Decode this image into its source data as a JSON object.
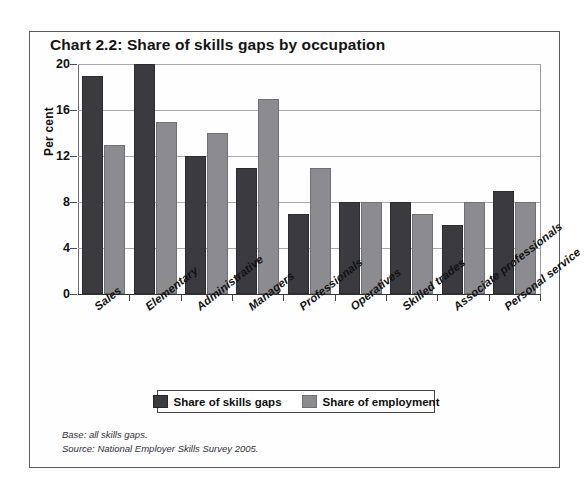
{
  "chart_data": {
    "type": "bar",
    "title": "Chart 2.2: Share of skills gaps by occupation",
    "xlabel": "",
    "ylabel": "Per cent",
    "ylim": [
      0,
      20
    ],
    "yticks": [
      0,
      4,
      8,
      12,
      16,
      20
    ],
    "grid": true,
    "legend_position": "bottom",
    "categories": [
      "Sales",
      "Elementary",
      "Administrative",
      "Managers",
      "Professionals",
      "Operatives",
      "Skilled trades",
      "Associate professionals",
      "Personal service"
    ],
    "series": [
      {
        "name": "Share of skills gaps",
        "color": "#3b3b3f",
        "values": [
          19,
          20,
          12,
          11,
          7,
          8,
          8,
          6,
          9
        ]
      },
      {
        "name": "Share of employment",
        "color": "#8b8b90",
        "values": [
          13,
          15,
          14,
          17,
          11,
          8,
          7,
          8,
          8
        ]
      }
    ],
    "notes": [
      "Base: all skills gaps.",
      "Source: National Employer Skills Survey 2005."
    ]
  },
  "footnotes": {
    "base": "Base: all skills gaps.",
    "source": "Source: National Employer Skills Survey 2005."
  }
}
